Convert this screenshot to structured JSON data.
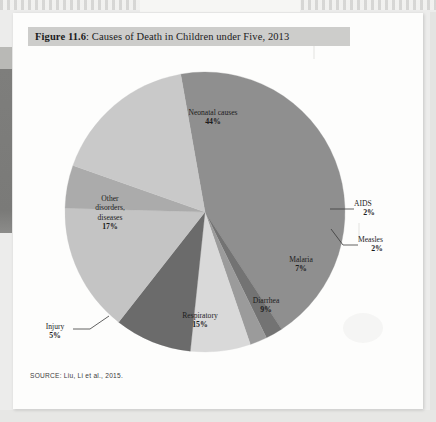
{
  "figure": {
    "number_label": "Figure 11.6",
    "separator": ": ",
    "title": "Causes of Death in Children under Five, 2013",
    "full_title": "Figure 11.6: Causes of Death in Children under Five, 2013",
    "source": "SOURCE: Liu, Li et al., 2015."
  },
  "colors": {
    "page": "#fdfdfc",
    "backdrop": "#ececeb",
    "title_highlight": "#cdcdcb",
    "spine": "#7e7e7c",
    "text": "#1c1c1c",
    "leader_line": "#3a3a3a"
  },
  "chart_data": {
    "type": "pie",
    "title": "Causes of Death in Children under Five, 2013",
    "subtitle": "",
    "xlabel": "",
    "ylabel": "",
    "units": "percent",
    "total": 101,
    "legend_position": "none",
    "grid": false,
    "labels_inside": true,
    "start_angle_deg": -100,
    "direction": "clockwise",
    "categories": [
      "Neonatal causes",
      "AIDS",
      "Measles",
      "Malaria",
      "Diarrhea",
      "Respiratory",
      "Injury",
      "Other disorders, diseases"
    ],
    "values": [
      44,
      2,
      2,
      7,
      9,
      15,
      5,
      17
    ],
    "value_labels": [
      "44%",
      "2%",
      "2%",
      "7%",
      "9%",
      "15%",
      "5%",
      "17%"
    ],
    "slice_colors": [
      "#8f8f8f",
      "#737373",
      "#9b9b9b",
      "#d9d9d9",
      "#6b6b6b",
      "#c4c4c4",
      "#ababab",
      "#c9c9c9"
    ],
    "slices": [
      {
        "name": "Neonatal causes",
        "value": 44,
        "label": "44%",
        "color": "#8f8f8f",
        "label_lines": [
          "Neonatal causes"
        ],
        "label_placement": "inside",
        "label_x": 200,
        "label_y": 60
      },
      {
        "name": "AIDS",
        "value": 2,
        "label": "2%",
        "color": "#737373",
        "label_lines": [
          "AIDS"
        ],
        "label_placement": "callout",
        "label_x": 360,
        "label_y": 196
      },
      {
        "name": "Measles",
        "value": 2,
        "label": "2%",
        "color": "#9b9b9b",
        "label_lines": [
          "Measles"
        ],
        "label_placement": "callout",
        "label_x": 364,
        "label_y": 233
      },
      {
        "name": "Malaria",
        "value": 7,
        "label": "7%",
        "color": "#d9d9d9",
        "label_lines": [
          "Malaria"
        ],
        "label_placement": "inside",
        "label_x": 293,
        "label_y": 247
      },
      {
        "name": "Diarrhea",
        "value": 9,
        "label": "9%",
        "color": "#6b6b6b",
        "label_lines": [
          "Diarrhea"
        ],
        "label_placement": "inside",
        "label_x": 258,
        "label_y": 288
      },
      {
        "name": "Respiratory",
        "value": 15,
        "label": "15%",
        "color": "#c4c4c4",
        "label_lines": [
          "Respiratory"
        ],
        "label_placement": "inside",
        "label_x": 192,
        "label_y": 303
      },
      {
        "name": "Injury",
        "value": 5,
        "label": "5%",
        "color": "#ababab",
        "label_lines": [
          "Injury"
        ],
        "label_placement": "callout",
        "label_x": 74,
        "label_y": 316
      },
      {
        "name": "Other disorders, diseases",
        "value": 17,
        "label": "17%",
        "color": "#c9c9c9",
        "label_lines": [
          "Other",
          "disorders,",
          "diseases"
        ],
        "label_placement": "inside",
        "label_x": 108,
        "label_y": 198
      }
    ],
    "geometry": {
      "center_x": 205,
      "center_y": 212,
      "radius": 140
    }
  }
}
